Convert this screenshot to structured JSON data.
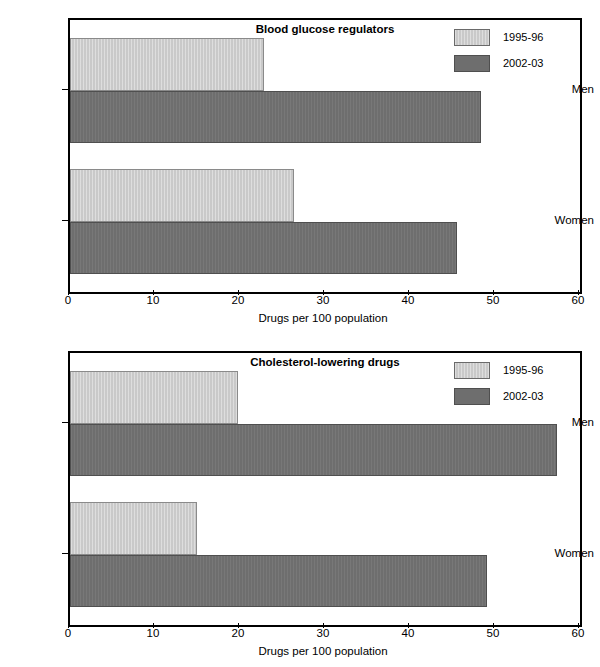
{
  "chart_data": [
    {
      "type": "bar",
      "orientation": "horizontal",
      "title": "Blood glucose regulators",
      "xlabel": "Drugs per 100 population",
      "ylabel": "",
      "categories": [
        "Men",
        "Women"
      ],
      "series": [
        {
          "name": "1995-96",
          "color": "#c9c9c9",
          "values": [
            22.8,
            26.4
          ]
        },
        {
          "name": "2002-03",
          "color": "#6e6e6e",
          "values": [
            48.4,
            45.5
          ]
        }
      ],
      "xlim": [
        0,
        60
      ],
      "xticks": [
        0,
        10,
        20,
        30,
        40,
        50,
        60
      ],
      "grid": false,
      "legend_position": "top-right"
    },
    {
      "type": "bar",
      "orientation": "horizontal",
      "title": "Cholesterol-lowering drugs",
      "xlabel": "Drugs per 100 population",
      "ylabel": "",
      "categories": [
        "Men",
        "Women"
      ],
      "series": [
        {
          "name": "1995-96",
          "color": "#c9c9c9",
          "values": [
            19.8,
            14.9
          ]
        },
        {
          "name": "2002-03",
          "color": "#6e6e6e",
          "values": [
            57.3,
            49.0
          ]
        }
      ],
      "xlim": [
        0,
        60
      ],
      "xticks": [
        0,
        10,
        20,
        30,
        40,
        50,
        60
      ],
      "grid": false,
      "legend_position": "top-right"
    }
  ]
}
